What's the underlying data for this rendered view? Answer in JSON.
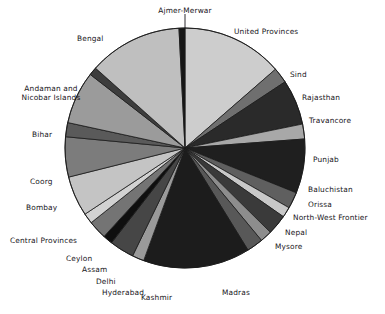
{
  "chart_data": {
    "type": "pie",
    "title": "",
    "subtitle": "",
    "xlabel": "",
    "ylabel": "",
    "legend_position": "none",
    "grid": false,
    "labels_outside": true,
    "start_angle_deg": 0,
    "direction": "clockwise",
    "center_px": [
      185,
      148
    ],
    "radius_px": 120,
    "categories": [
      "United Provinces",
      "Sind",
      "Rajasthan",
      "Travancore",
      "Punjab",
      "Baluchistan",
      "Orissa",
      "North-West Frontier",
      "Nepal",
      "Mysore",
      "Madras",
      "Kashmir",
      "Hyderabad",
      "Delhi",
      "Assam",
      "Ceylon",
      "Central Provinces",
      "Bombay",
      "Coorg",
      "Bihar",
      "Andaman and Nicobar Islands",
      "Bengal",
      "Ajmer-Merwar"
    ],
    "values": [
      13.6,
      2.1,
      6.1,
      2.0,
      7.3,
      2.2,
      1.4,
      2.7,
      1.6,
      2.2,
      14.4,
      1.6,
      3.3,
      1.3,
      2.5,
      1.4,
      5.4,
      5.4,
      1.9,
      7.1,
      1.1,
      12.6,
      0.8
    ],
    "slice_colors": [
      "#cdcdcd",
      "#6f6f6f",
      "#2a2a2a",
      "#a8a8a8",
      "#1f1f1f",
      "#5f5f5f",
      "#c8c8c8",
      "#3a3a3a",
      "#8d8d8d",
      "#585858",
      "#1c1c1c",
      "#9a9a9a",
      "#464646",
      "#0f0f0f",
      "#747474",
      "#d2d2d2",
      "#c4c4c4",
      "#7c7c7c",
      "#5a5a5a",
      "#9b9b9b",
      "#3d3d3d",
      "#bfbfbf",
      "#161616"
    ],
    "slice_edge_color": "#1a1a1a",
    "background": "#ffffff"
  },
  "labels": {
    "ajmer_merwar": "Ajmer-Merwar",
    "united_provinces": "United Provinces",
    "sind": "Sind",
    "rajasthan": "Rajasthan",
    "travancore": "Travancore",
    "punjab": "Punjab",
    "baluchistan": "Baluchistan",
    "orissa": "Orissa",
    "north_west_frontier": "North-West Frontier",
    "nepal": "Nepal",
    "mysore": "Mysore",
    "madras": "Madras",
    "kashmir": "Kashmir",
    "hyderabad": "Hyderabad",
    "delhi": "Delhi",
    "assam": "Assam",
    "ceylon": "Ceylon",
    "central_provinces": "Central Provinces",
    "bombay": "Bombay",
    "coorg": "Coorg",
    "bihar": "Bihar",
    "andaman_line1": "Andaman and",
    "andaman_line2": "Nicobar Islands",
    "bengal": "Bengal"
  }
}
